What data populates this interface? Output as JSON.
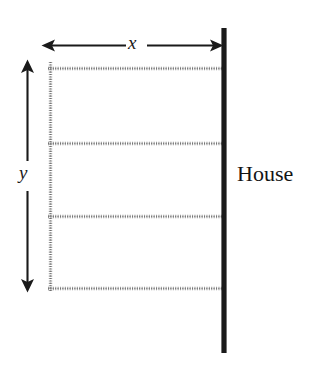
{
  "diagram": {
    "type": "geometry-diagram",
    "background_color": "#ffffff",
    "labels": {
      "width_label": "x",
      "height_label": "y",
      "house_label": "House"
    },
    "colors": {
      "wall": "#1a1a1a",
      "fence": "#8a8a8a",
      "arrow": "#1a1a1a",
      "text": "#141414"
    },
    "elements": {
      "house_wall": {
        "name": "house-wall",
        "orientation": "vertical",
        "x": 224,
        "y_start": 28,
        "y_end": 353,
        "thickness": 5,
        "style": "solid"
      },
      "width_arrow": {
        "name": "width-dimension-arrow",
        "orientation": "horizontal",
        "y": 45,
        "x_start": 42,
        "x_end": 223,
        "heads": "both"
      },
      "height_arrow": {
        "name": "height-dimension-arrow",
        "orientation": "vertical",
        "x": 27,
        "y_start": 60,
        "y_end": 292,
        "heads": "both"
      },
      "fence_left": {
        "name": "fence-segment-left",
        "orientation": "vertical",
        "x": 50,
        "y_start": 62,
        "y_end": 292,
        "style": "dotted"
      },
      "fence_horizontals": [
        {
          "name": "fence-segment-top",
          "y": 68,
          "x_start": 48,
          "x_end": 224,
          "style": "dotted"
        },
        {
          "name": "fence-segment-divider-1",
          "y": 143,
          "x_start": 48,
          "x_end": 224,
          "style": "dotted"
        },
        {
          "name": "fence-segment-divider-2",
          "y": 216,
          "x_start": 48,
          "x_end": 224,
          "style": "dotted"
        },
        {
          "name": "fence-segment-bottom",
          "y": 288,
          "x_start": 48,
          "x_end": 224,
          "style": "dotted"
        }
      ]
    },
    "counts": {
      "horizontal_fence_lines": 4,
      "vertical_fence_lines": 1,
      "interior_pens": 3
    }
  }
}
